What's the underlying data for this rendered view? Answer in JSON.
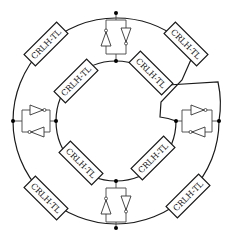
{
  "diagram": {
    "center": [
      116,
      121
    ],
    "outer_radius": 103,
    "inner_radius": 60,
    "colors": {
      "stroke": "#1a1a1a",
      "background": "#ffffff",
      "node": "#000000"
    },
    "tl_sections": [
      {
        "id": "outer-top-left",
        "ring": "outer",
        "label": "CRLH-TL"
      },
      {
        "id": "outer-top-right",
        "ring": "outer",
        "label": "CRLH-TL"
      },
      {
        "id": "outer-bottom-left",
        "ring": "outer",
        "label": "CRLH-TL"
      },
      {
        "id": "outer-bottom-right",
        "ring": "outer",
        "label": "CRLH-TL"
      },
      {
        "id": "inner-top-left",
        "ring": "inner",
        "label": "CRLH-TL"
      },
      {
        "id": "inner-top-right",
        "ring": "inner",
        "label": "CRLH-TL"
      },
      {
        "id": "inner-bottom-left",
        "ring": "inner",
        "label": "CRLH-TL"
      },
      {
        "id": "inner-bottom-right",
        "ring": "inner",
        "label": "CRLH-TL"
      }
    ],
    "amplifier_pairs": [
      {
        "id": "top",
        "type": "anti-parallel amplifiers"
      },
      {
        "id": "left",
        "type": "anti-parallel amplifiers"
      },
      {
        "id": "right",
        "type": "anti-parallel amplifiers"
      },
      {
        "id": "bottom",
        "type": "anti-parallel amplifiers"
      }
    ],
    "crossover": "top-right (outer and inner rings swap)"
  }
}
